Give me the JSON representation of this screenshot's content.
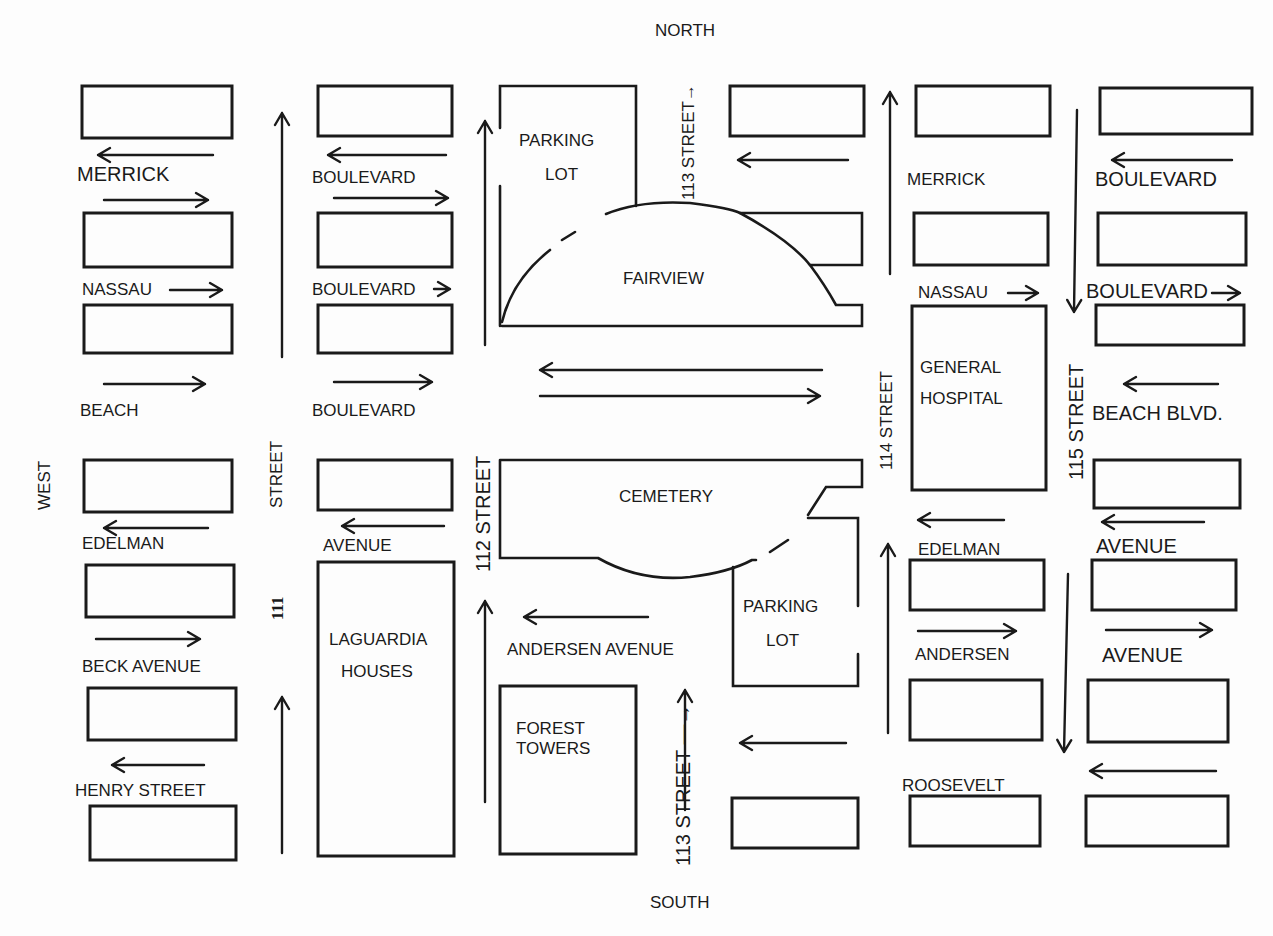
{
  "compass": {
    "north": "NORTH",
    "south": "SOUTH",
    "west": "WEST"
  },
  "colors": {
    "ink": "#1a1a1a",
    "paper": "#fdfdfd"
  },
  "blocks": [
    [
      82,
      86,
      150,
      52
    ],
    [
      318,
      86,
      134,
      50
    ],
    [
      730,
      86,
      134,
      50
    ],
    [
      916,
      86,
      134,
      50
    ],
    [
      1100,
      88,
      152,
      46
    ],
    [
      84,
      213,
      148,
      54
    ],
    [
      318,
      213,
      134,
      54
    ],
    [
      914,
      213,
      134,
      52
    ],
    [
      1098,
      213,
      148,
      52
    ],
    [
      84,
      305,
      148,
      48
    ],
    [
      318,
      305,
      134,
      48
    ],
    [
      1096,
      305,
      148,
      40
    ],
    [
      84,
      460,
      148,
      52
    ],
    [
      318,
      460,
      134,
      50
    ],
    [
      1094,
      460,
      146,
      48
    ],
    [
      86,
      565,
      148,
      52
    ],
    [
      910,
      560,
      134,
      50
    ],
    [
      1092,
      560,
      144,
      50
    ],
    [
      88,
      688,
      148,
      52
    ],
    [
      910,
      680,
      132,
      60
    ],
    [
      1088,
      680,
      140,
      62
    ],
    [
      90,
      806,
      146,
      54
    ],
    [
      732,
      798,
      126,
      50
    ],
    [
      910,
      796,
      130,
      50
    ],
    [
      1086,
      796,
      142,
      50
    ],
    [
      500,
      686,
      136,
      168
    ],
    [
      318,
      562,
      136,
      294
    ],
    [
      912,
      306,
      134,
      184
    ]
  ],
  "landmarks": {
    "parking_lot_north": [
      "PARKING",
      "LOT"
    ],
    "fairview": "FAIRVIEW",
    "cemetery": "CEMETERY",
    "parking_lot_south": [
      "PARKING",
      "LOT"
    ],
    "general_hospital": [
      "GENERAL",
      "HOSPITAL"
    ],
    "laguardia_houses": [
      "LAGUARDIA",
      "HOUSES"
    ],
    "forest_towers": [
      "FOREST",
      "TOWERS"
    ]
  },
  "street_labels": {
    "merrick_w": "MERRICK",
    "boulevard_w1": "BOULEVARD",
    "merrick_e": "MERRICK",
    "boulevard_e1": "BOULEVARD",
    "nassau_w": "NASSAU",
    "boulevard_w2": "BOULEVARD",
    "nassau_e": "NASSAU",
    "boulevard_e2": "BOULEVARD",
    "beach_w": "BEACH",
    "boulevard_w3": "BOULEVARD",
    "beach_blvd_e": "BEACH BLVD.",
    "edelman_w": "EDELMAN",
    "avenue_w1": "AVENUE",
    "edelman_e": "EDELMAN",
    "avenue_e1": "AVENUE",
    "beck_avenue": "BECK AVENUE",
    "andersen_avenue_mid": "ANDERSEN AVENUE",
    "andersen_e": "ANDERSEN",
    "avenue_e2": "AVENUE",
    "henry_street": "HENRY STREET",
    "roosevelt": "ROOSEVELT",
    "street_111_a": "STREET",
    "street_111_b": "111",
    "street_112": "112 STREET",
    "street_113_north": "113 STREET→",
    "street_113_south": "113  STREET —→",
    "street_114": "114 STREET",
    "street_115": "115 STREET"
  },
  "arrows": [
    {
      "x1": 213,
      "y1": 155,
      "x2": 98,
      "y2": 155
    },
    {
      "x1": 104,
      "y1": 200,
      "x2": 208,
      "y2": 200
    },
    {
      "x1": 170,
      "y1": 290,
      "x2": 222,
      "y2": 290
    },
    {
      "x1": 104,
      "y1": 384,
      "x2": 205,
      "y2": 384
    },
    {
      "x1": 208,
      "y1": 528,
      "x2": 104,
      "y2": 528
    },
    {
      "x1": 96,
      "y1": 639,
      "x2": 200,
      "y2": 639
    },
    {
      "x1": 204,
      "y1": 765,
      "x2": 112,
      "y2": 765
    },
    {
      "x1": 446,
      "y1": 155,
      "x2": 328,
      "y2": 155
    },
    {
      "x1": 334,
      "y1": 198,
      "x2": 448,
      "y2": 198
    },
    {
      "x1": 434,
      "y1": 289,
      "x2": 450,
      "y2": 289
    },
    {
      "x1": 334,
      "y1": 382,
      "x2": 432,
      "y2": 382
    },
    {
      "x1": 444,
      "y1": 526,
      "x2": 342,
      "y2": 526
    },
    {
      "x1": 282,
      "y1": 357,
      "x2": 282,
      "y2": 113
    },
    {
      "x1": 282,
      "y1": 853,
      "x2": 282,
      "y2": 697
    },
    {
      "x1": 485,
      "y1": 345,
      "x2": 485,
      "y2": 121
    },
    {
      "x1": 485,
      "y1": 802,
      "x2": 485,
      "y2": 601
    },
    {
      "x1": 822,
      "y1": 370,
      "x2": 540,
      "y2": 370
    },
    {
      "x1": 540,
      "y1": 396,
      "x2": 820,
      "y2": 396
    },
    {
      "x1": 648,
      "y1": 617,
      "x2": 524,
      "y2": 617
    },
    {
      "x1": 848,
      "y1": 160,
      "x2": 738,
      "y2": 160
    },
    {
      "x1": 846,
      "y1": 743,
      "x2": 740,
      "y2": 743
    },
    {
      "x1": 890,
      "y1": 274,
      "x2": 890,
      "y2": 92
    },
    {
      "x1": 888,
      "y1": 733,
      "x2": 888,
      "y2": 544
    },
    {
      "x1": 1077,
      "y1": 110,
      "x2": 1074,
      "y2": 312
    },
    {
      "x1": 1068,
      "y1": 574,
      "x2": 1064,
      "y2": 752
    },
    {
      "x1": 1008,
      "y1": 293,
      "x2": 1038,
      "y2": 293
    },
    {
      "x1": 1004,
      "y1": 520,
      "x2": 918,
      "y2": 520
    },
    {
      "x1": 918,
      "y1": 631,
      "x2": 1016,
      "y2": 631
    },
    {
      "x1": 1232,
      "y1": 160,
      "x2": 1112,
      "y2": 160
    },
    {
      "x1": 1212,
      "y1": 293,
      "x2": 1240,
      "y2": 293
    },
    {
      "x1": 1218,
      "y1": 384,
      "x2": 1124,
      "y2": 384
    },
    {
      "x1": 1204,
      "y1": 522,
      "x2": 1102,
      "y2": 522
    },
    {
      "x1": 1106,
      "y1": 630,
      "x2": 1212,
      "y2": 630
    },
    {
      "x1": 1216,
      "y1": 771,
      "x2": 1090,
      "y2": 771
    },
    {
      "x1": 685,
      "y1": 810,
      "x2": 685,
      "y2": 690
    }
  ]
}
